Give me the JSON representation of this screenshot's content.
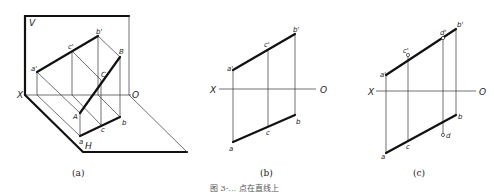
{
  "figure": {
    "panels": [
      {
        "id": "a",
        "caption": "(a)",
        "plane_labels": {
          "v": "V",
          "h": "H"
        },
        "axis_labels": {
          "x": "X",
          "o": "O"
        },
        "points": {
          "a_prime": "a'",
          "c_prime": "c'",
          "b_prime": "b'",
          "A": "A",
          "B": "B",
          "C": "C",
          "a": "a",
          "b": "b",
          "c": "c"
        }
      },
      {
        "id": "b",
        "caption": "(b)",
        "axis_labels": {
          "x": "X",
          "o": "O"
        },
        "points": {
          "a_prime": "a'",
          "c_prime": "c'",
          "b_prime": "b'",
          "a": "a",
          "c": "c",
          "b": "b"
        }
      },
      {
        "id": "c",
        "caption": "(c)",
        "axis_labels": {
          "x": "X",
          "o": "O"
        },
        "points": {
          "a_prime": "a'",
          "c_prime": "c'",
          "d_prime": "d'",
          "b_prime": "b'",
          "a": "a",
          "c": "c",
          "b": "b",
          "d": "d"
        }
      }
    ],
    "footer_caption": "图 3-… 点在直线上"
  }
}
